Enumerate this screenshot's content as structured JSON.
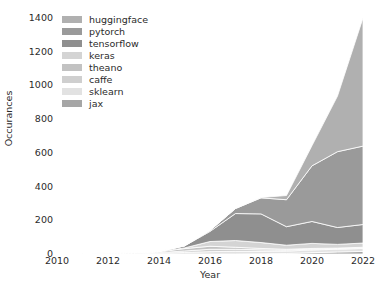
{
  "chart_data": {
    "type": "area",
    "stacked": true,
    "title": "",
    "xlabel": "Year",
    "ylabel": "Occurances",
    "x": [
      2010,
      2011,
      2012,
      2013,
      2014,
      2015,
      2016,
      2017,
      2018,
      2019,
      2020,
      2021,
      2022
    ],
    "xlim": [
      2010,
      2022
    ],
    "ylim": [
      0,
      1400
    ],
    "yticks": [
      0,
      200,
      400,
      600,
      800,
      1000,
      1200,
      1400
    ],
    "xticks": [
      2010,
      2012,
      2014,
      2016,
      2018,
      2020,
      2022
    ],
    "ytick_labels": [
      "0",
      "200",
      "400",
      "600",
      "800",
      "1000",
      "1200",
      "1400"
    ],
    "xtick_labels": [
      "2010",
      "2012",
      "2014",
      "2016",
      "2018",
      "2020",
      "2022"
    ],
    "grid": false,
    "spines": false,
    "legend_position": "upper left",
    "stack_order_bottom_to_top": [
      "jax",
      "sklearn",
      "caffe",
      "theano",
      "keras",
      "tensorflow",
      "pytorch",
      "huggingface"
    ],
    "series": [
      {
        "name": "huggingface",
        "color": "#b0b0b0",
        "values": [
          0,
          0,
          0,
          0,
          0,
          0,
          0,
          0,
          2,
          25,
          120,
          330,
          760
        ]
      },
      {
        "name": "pytorch",
        "color": "#9a9a9a",
        "values": [
          0,
          0,
          0,
          0,
          0,
          1,
          6,
          30,
          95,
          160,
          330,
          450,
          465
        ]
      },
      {
        "name": "tensorflow",
        "color": "#8f8f8f",
        "values": [
          0,
          0,
          0,
          0,
          1,
          12,
          60,
          160,
          170,
          110,
          130,
          100,
          110
        ]
      },
      {
        "name": "keras",
        "color": "#d4d4d4",
        "values": [
          0,
          0,
          0,
          0,
          0,
          4,
          28,
          40,
          35,
          24,
          30,
          22,
          25
        ]
      },
      {
        "name": "theano",
        "color": "#c2c2c2",
        "values": [
          2,
          3,
          5,
          4,
          6,
          14,
          18,
          12,
          8,
          5,
          4,
          3,
          3
        ]
      },
      {
        "name": "caffe",
        "color": "#cfcfcf",
        "values": [
          0,
          0,
          0,
          1,
          3,
          9,
          14,
          12,
          9,
          6,
          5,
          4,
          4
        ]
      },
      {
        "name": "sklearn",
        "color": "#e2e2e2",
        "values": [
          0,
          1,
          2,
          3,
          5,
          9,
          14,
          16,
          15,
          14,
          16,
          16,
          18
        ],
        "note": "light band near baseline"
      },
      {
        "name": "jax",
        "color": "#a6a6a6",
        "values": [
          0,
          0,
          0,
          0,
          0,
          0,
          0,
          0,
          1,
          3,
          8,
          12,
          15
        ]
      }
    ],
    "totals_by_year": [
      2,
      4,
      7,
      8,
      15,
      49,
      140,
      270,
      335,
      347,
      643,
      937,
      1400
    ],
    "annotations": []
  },
  "legend": {
    "items": [
      {
        "label": "huggingface",
        "color": "#b0b0b0"
      },
      {
        "label": "pytorch",
        "color": "#9a9a9a"
      },
      {
        "label": "tensorflow",
        "color": "#8f8f8f"
      },
      {
        "label": "keras",
        "color": "#d4d4d4"
      },
      {
        "label": "theano",
        "color": "#c2c2c2"
      },
      {
        "label": "caffe",
        "color": "#cfcfcf"
      },
      {
        "label": "sklearn",
        "color": "#e2e2e2"
      },
      {
        "label": "jax",
        "color": "#a6a6a6"
      }
    ]
  },
  "style": {
    "background": "#ffffff",
    "text_color": "#2b2b2b",
    "edge_color": "#ffffff"
  }
}
